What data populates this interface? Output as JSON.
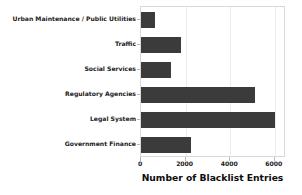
{
  "chart_data": {
    "type": "bar",
    "orientation": "horizontal",
    "title": "",
    "xlabel": "Number of Blacklist Entries",
    "ylabel": "",
    "categories": [
      "Urban Maintenance / Public Utilities",
      "Traffic",
      "Social Services",
      "Regulatory Agencies",
      "Legal System",
      "Government Finance"
    ],
    "values": [
      630,
      1800,
      1350,
      5100,
      6000,
      2250
    ],
    "xlim": [
      0,
      6500
    ],
    "xticks": [
      0,
      2000,
      4000,
      6000
    ],
    "xtick_labels": [
      "0",
      "2000",
      "4000",
      "6000"
    ],
    "grid": true,
    "legend": false,
    "bar_color": "#3b3b3b",
    "background_color": "#ffffff",
    "gridline_color": "#ececec",
    "axis_color": "#d8d8d8"
  }
}
